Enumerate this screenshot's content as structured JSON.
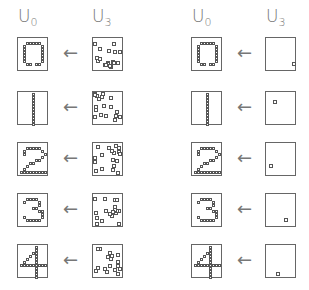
{
  "panels": [
    {
      "name": "left",
      "headers": [
        {
          "base": "U",
          "sub": "0"
        },
        {
          "base": "U",
          "sub": "3"
        }
      ],
      "rows": [
        {
          "digit": "0",
          "noise": "dense"
        },
        {
          "digit": "1",
          "noise": "dense"
        },
        {
          "digit": "2",
          "noise": "dense"
        },
        {
          "digit": "3",
          "noise": "dense"
        },
        {
          "digit": "4",
          "noise": "dense"
        }
      ]
    },
    {
      "name": "right",
      "headers": [
        {
          "base": "U",
          "sub": "0"
        },
        {
          "base": "U",
          "sub": "3"
        }
      ],
      "rows": [
        {
          "digit": "0",
          "noise": "single"
        },
        {
          "digit": "1",
          "noise": "single"
        },
        {
          "digit": "2",
          "noise": "single"
        },
        {
          "digit": "3",
          "noise": "single"
        },
        {
          "digit": "4",
          "noise": "single"
        }
      ]
    }
  ],
  "arrow_glyph": "←"
}
